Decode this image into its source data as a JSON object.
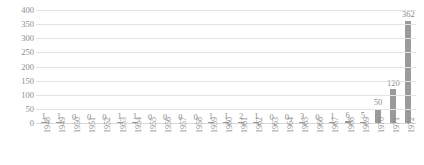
{
  "chart_data": {
    "type": "bar",
    "title": "",
    "subtitle": "",
    "xlabel": "",
    "ylabel": "",
    "categories": [
      "1948",
      "1949",
      "1950",
      "1951",
      "1952",
      "1953",
      "1954",
      "1955",
      "1956",
      "1957",
      "1958",
      "1959",
      "1960",
      "1961",
      "1962",
      "1963",
      "1964",
      "1965",
      "1966",
      "1967",
      "1968",
      "1969",
      "1970",
      "1971",
      "1972"
    ],
    "values": [
      1,
      1,
      0,
      0,
      0,
      1,
      1,
      0,
      0,
      0,
      0,
      1,
      1,
      2,
      1,
      0,
      0,
      3,
      0,
      1,
      6,
      5,
      50,
      120,
      362
    ],
    "data_labels": [
      "1",
      "1",
      "0",
      "0",
      "0",
      "1",
      "1",
      "0",
      "0",
      "0",
      "0",
      "1",
      "1",
      "2",
      "1",
      "0",
      "0",
      "3",
      "0",
      "1",
      "6",
      "5",
      "50",
      "120",
      "362"
    ],
    "ylim": [
      0,
      400
    ],
    "yticks": [
      400,
      350,
      300,
      250,
      200,
      150,
      100,
      50,
      0
    ],
    "ytick_labels": [
      "400",
      "350",
      "300",
      "250",
      "200",
      "150",
      "100",
      "50",
      "0"
    ],
    "grid": true,
    "legend": false,
    "legend_position": "none",
    "bar_color": "#9a9a9a",
    "grid_color": "#e3e3e3",
    "text_color": "#8d8d8d"
  }
}
